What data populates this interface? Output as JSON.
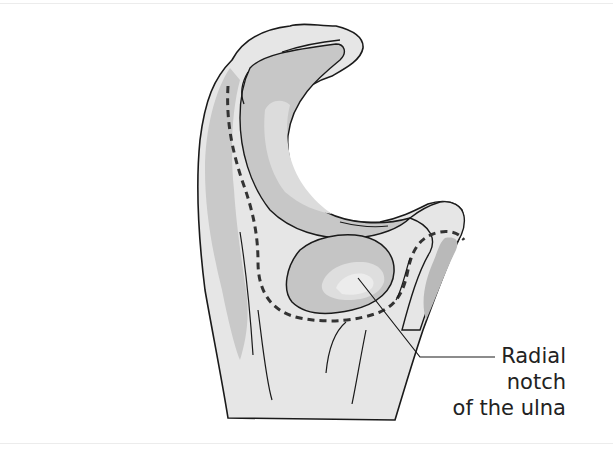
{
  "figure": {
    "labels": [
      {
        "id": "radial-notch",
        "lines": [
          "Radial",
          "notch",
          "of the ulna"
        ]
      }
    ]
  },
  "colors": {
    "outline": "#1a1a1a",
    "bone_light": "#e6e6e6",
    "bone_mid": "#cfcfcf",
    "bone_dark": "#b5b5b5",
    "cartilage_highlight": "#dcdcdc",
    "dashed_line": "#333333",
    "label_text": "#222222"
  }
}
